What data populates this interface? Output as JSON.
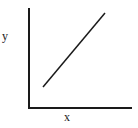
{
  "diagram": {
    "type": "line-graph-sketch",
    "x_axis_label": "x",
    "y_axis_label": "y",
    "axis_color": "#1a1a1a",
    "line_color": "#1a1a1a",
    "axes": {
      "origin": [
        29,
        108
      ],
      "y_axis_top": [
        29,
        8
      ],
      "x_axis_end": [
        132,
        108
      ]
    },
    "line": {
      "start": [
        43,
        87
      ],
      "end": [
        105,
        13
      ],
      "trend": "increasing"
    }
  }
}
